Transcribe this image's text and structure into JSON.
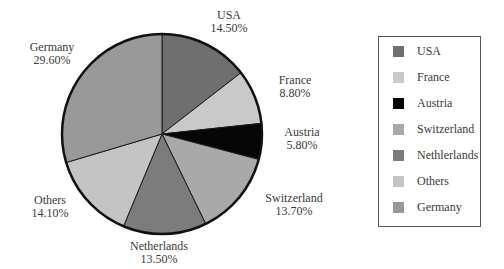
{
  "chart_data": {
    "type": "pie",
    "title": "",
    "start_angle_deg": 0,
    "direction": "clockwise",
    "slices": [
      {
        "label": "USA",
        "value": 14.5,
        "display": "14.50%",
        "color": "#6f6f6f"
      },
      {
        "label": "France",
        "value": 8.8,
        "display": "8.80%",
        "color": "#c9c9c9"
      },
      {
        "label": "Austria",
        "value": 5.8,
        "display": "5.80%",
        "color": "#060606"
      },
      {
        "label": "Switzerland",
        "value": 13.7,
        "display": "13.70%",
        "color": "#a9a9a9"
      },
      {
        "label": "Netherlands",
        "value": 13.5,
        "display": "13.50%",
        "color": "#7c7c7c"
      },
      {
        "label": "Others",
        "value": 14.1,
        "display": "14.10%",
        "color": "#c4c4c4"
      },
      {
        "label": "Germany",
        "value": 29.6,
        "display": "29.60%",
        "color": "#999999"
      }
    ],
    "legend": {
      "position": "right",
      "entries": [
        "USA",
        "France",
        "Austria",
        "Switzerland",
        "Nethlerlands",
        "Others",
        "Germany"
      ]
    }
  },
  "labels": {
    "usa": {
      "name": "USA",
      "pct": "14.50%"
    },
    "france": {
      "name": "France",
      "pct": "8.80%"
    },
    "austria": {
      "name": "Austria",
      "pct": "5.80%"
    },
    "switzerland": {
      "name": "Switzerland",
      "pct": "13.70%"
    },
    "netherlands": {
      "name": "Netherlands",
      "pct": "13.50%"
    },
    "others": {
      "name": "Others",
      "pct": "14.10%"
    },
    "germany": {
      "name": "Germany",
      "pct": "29.60%"
    }
  },
  "legend": {
    "items": [
      {
        "label": "USA",
        "color": "#6f6f6f"
      },
      {
        "label": "France",
        "color": "#c9c9c9"
      },
      {
        "label": "Austria",
        "color": "#060606"
      },
      {
        "label": "Switzerland",
        "color": "#a9a9a9"
      },
      {
        "label": "Nethlerlands",
        "color": "#7c7c7c"
      },
      {
        "label": "Others",
        "color": "#c4c4c4"
      },
      {
        "label": "Germany",
        "color": "#999999"
      }
    ]
  }
}
